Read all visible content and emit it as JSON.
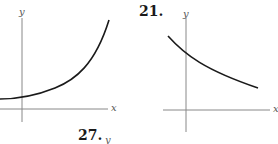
{
  "figures": [
    {
      "number": "",
      "curve": "increasing-exponential",
      "x_axis_label": "x",
      "y_axis_label": "y"
    },
    {
      "number": "21.",
      "curve": "decreasing-exponential",
      "x_axis_label": "x",
      "y_axis_label": "y"
    },
    {
      "number": "27.",
      "curve": "",
      "x_axis_label": "",
      "y_axis_label": "y"
    }
  ]
}
